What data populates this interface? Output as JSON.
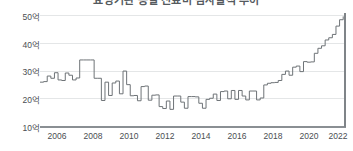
{
  "chart": {
    "title": "요양기관 종별 진료비 심사실적 추이",
    "unit_suffix": "억"
  },
  "yaxis": {
    "ticks": [
      "50억",
      "40억",
      "30억",
      "20억",
      "10억"
    ]
  },
  "xaxis": {
    "ticks": [
      "2006",
      "2008",
      "2010",
      "2012",
      "2014",
      "2016",
      "2018",
      "2020",
      "2022"
    ]
  },
  "colors": {
    "line": "#6e7377",
    "grid": "#e4e6e7",
    "axis": "#8a8f93",
    "text": "#4a4e52",
    "background": "#ffffff"
  },
  "chart_data": {
    "type": "line",
    "title": "요양기관 종별 진료비 심사실적 추이",
    "xlabel": "",
    "ylabel": "억",
    "xlim": [
      2006.0,
      2022.9
    ],
    "ylim": [
      10,
      50
    ],
    "grid": true,
    "legend": "none",
    "ytick_values": [
      50,
      40,
      30,
      20,
      10
    ],
    "ytick_labels": [
      "50억",
      "40억",
      "30억",
      "20억",
      "10억"
    ],
    "xtick_values": [
      2006,
      2008,
      2010,
      2012,
      2014,
      2016,
      2018,
      2020,
      2022
    ],
    "xtick_labels": [
      "2006",
      "2008",
      "2010",
      "2012",
      "2014",
      "2016",
      "2018",
      "2020",
      "2022"
    ],
    "series": [
      {
        "name": "진료비",
        "x": [
          2006.0,
          2006.2,
          2006.4,
          2006.6,
          2006.8,
          2007.0,
          2007.2,
          2007.4,
          2007.6,
          2007.8,
          2008.0,
          2008.2,
          2008.4,
          2008.6,
          2008.8,
          2009.0,
          2009.2,
          2009.4,
          2009.6,
          2009.8,
          2010.0,
          2010.2,
          2010.4,
          2010.6,
          2010.8,
          2011.0,
          2011.2,
          2011.4,
          2011.6,
          2011.8,
          2012.0,
          2012.2,
          2012.4,
          2012.6,
          2012.8,
          2013.0,
          2013.2,
          2013.4,
          2013.6,
          2013.8,
          2014.0,
          2014.2,
          2014.4,
          2014.6,
          2014.8,
          2015.0,
          2015.2,
          2015.4,
          2015.6,
          2015.8,
          2016.0,
          2016.2,
          2016.4,
          2016.6,
          2016.8,
          2017.0,
          2017.2,
          2017.4,
          2017.6,
          2017.8,
          2018.0,
          2018.2,
          2018.4,
          2018.6,
          2018.8,
          2019.0,
          2019.2,
          2019.4,
          2019.6,
          2019.8,
          2020.0,
          2020.2,
          2020.4,
          2020.6,
          2020.8,
          2021.0,
          2021.2,
          2021.4,
          2021.6,
          2021.8,
          2022.0,
          2022.2,
          2022.4,
          2022.6,
          2022.8
        ],
        "values": [
          25.8,
          26.0,
          28.0,
          27.2,
          29.2,
          26.6,
          26.4,
          29.1,
          28.3,
          26.6,
          27.3,
          33.8,
          33.8,
          33.8,
          33.8,
          27.2,
          27.2,
          19.2,
          25.8,
          21.0,
          25.5,
          26.2,
          21.6,
          29.8,
          24.9,
          20.9,
          21.0,
          19.1,
          24.2,
          24.4,
          19.3,
          21.1,
          21.2,
          17.0,
          16.3,
          19.0,
          16.0,
          20.8,
          20.8,
          18.6,
          16.4,
          20.6,
          20.6,
          20.5,
          18.2,
          16.4,
          19.6,
          20.0,
          21.5,
          19.2,
          22.4,
          22.6,
          19.8,
          22.8,
          19.6,
          22.8,
          20.8,
          19.4,
          22.6,
          22.6,
          19.4,
          20.1,
          24.8,
          25.4,
          25.6,
          25.7,
          26.4,
          28.6,
          29.8,
          28.3,
          31.2,
          31.6,
          29.6,
          33.2,
          33.0,
          33.1,
          36.2,
          38.0,
          38.9,
          41.0,
          41.8,
          43.0,
          46.0,
          48.3,
          49.5
        ]
      }
    ]
  }
}
